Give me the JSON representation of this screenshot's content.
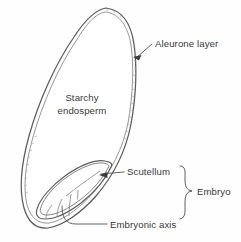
{
  "diagram": {
    "background_color": "#fefefe",
    "outline_color": "#5b5b5b",
    "label_color": "#3a3a3a",
    "leader_color": "#4a4a4a"
  },
  "labels": {
    "aleurone_layer": "Aleurone layer",
    "starchy_endosperm_line1": "Starchy",
    "starchy_endosperm_line2": "endosperm",
    "scutellum": "Scutellum",
    "embryonic_axis": "Embryonic axis",
    "embryo": "Embryo"
  },
  "parts": [
    {
      "id": "aleurone-layer",
      "label": "Aleurone layer",
      "pointer": "arrow",
      "target_x": 133,
      "target_y": 57
    },
    {
      "id": "starchy-endosperm",
      "label": "Starchy endosperm",
      "pointer": "none",
      "target_x": 82,
      "target_y": 105
    },
    {
      "id": "scutellum",
      "label": "Scutellum",
      "pointer": "arrow",
      "target_x": 100,
      "target_y": 174
    },
    {
      "id": "embryonic-axis",
      "label": "Embryonic axis",
      "pointer": "line",
      "target_x": 62,
      "target_y": 206
    },
    {
      "id": "embryo",
      "label": "Embryo",
      "pointer": "brace",
      "target_x": 185,
      "target_y": 200
    }
  ]
}
